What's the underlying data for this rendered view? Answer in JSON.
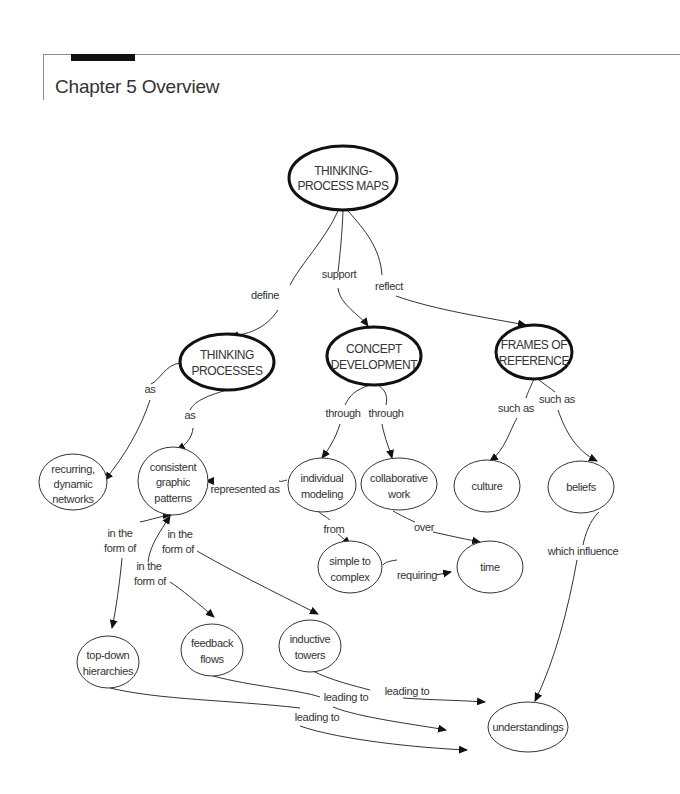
{
  "header": {
    "title": "Chapter 5 Overview"
  },
  "diagram": {
    "type": "concept-map",
    "nodes": {
      "root": [
        "THINKING-",
        "PROCESS MAPS"
      ],
      "thinking_processes": [
        "THINKING",
        "PROCESSES"
      ],
      "concept_development": [
        "CONCEPT",
        "DEVELOPMENT"
      ],
      "frames_of_reference": [
        "FRAMES OF",
        "REFERENCE"
      ],
      "recurring": [
        "recurring,",
        "dynamic",
        "networks"
      ],
      "consistent": [
        "consistent",
        "graphic",
        "patterns"
      ],
      "individual": [
        "individual",
        "modeling"
      ],
      "collaborative": [
        "collaborative",
        "work"
      ],
      "culture": [
        "culture"
      ],
      "beliefs": [
        "beliefs"
      ],
      "simple": [
        "simple to",
        "complex"
      ],
      "time": [
        "time"
      ],
      "topdown": [
        "top-down",
        "hierarchies"
      ],
      "feedback": [
        "feedback",
        "flows"
      ],
      "inductive": [
        "inductive",
        "towers"
      ],
      "understandings": [
        "understandings"
      ]
    },
    "links": {
      "define": "define",
      "support": "support",
      "reflect": "reflect",
      "as1": "as",
      "as2": "as",
      "through1": "through",
      "through2": "through",
      "such_as1": "such as",
      "such_as2": "such as",
      "represented_as": "represented as",
      "from": "from",
      "over": "over",
      "requiring": "requiring",
      "which_influence": "which influence",
      "form1": [
        "in the",
        "form of"
      ],
      "form2": [
        "in the",
        "form of"
      ],
      "form3": [
        "in the",
        "form of"
      ],
      "leading1": "leading to",
      "leading2": "leading to",
      "leading3": "leading to"
    }
  }
}
